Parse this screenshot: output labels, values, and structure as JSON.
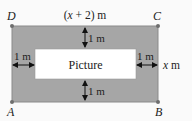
{
  "diagram": {
    "colors": {
      "background": "#fafafa",
      "border_fill": "#a6a6a6",
      "border_stroke": "#8a8a8a",
      "picture_fill": "#ffffff",
      "dot": "#6e6e6e",
      "text": "#222222"
    },
    "vertices": {
      "D": "D",
      "C": "C",
      "A": "A",
      "B": "B"
    },
    "labels": {
      "top_width": "(x + 2) m",
      "top_width_var": "x",
      "top_width_pre": "(",
      "top_width_post": " + 2) m",
      "picture": "Picture",
      "gap_top": "1 m",
      "gap_bottom": "1 m",
      "gap_left": "1 m",
      "gap_right": "1 m",
      "side_height": "x m",
      "side_height_var": "x",
      "side_height_unit": " m"
    }
  }
}
